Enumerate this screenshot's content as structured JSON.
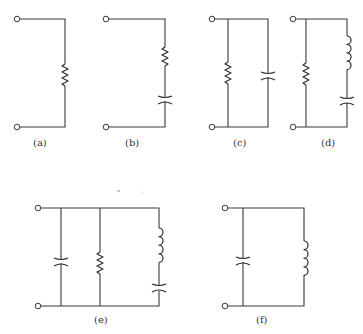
{
  "figure": {
    "circuits": [
      {
        "id": "a",
        "label": "(a)",
        "topology": "single element",
        "elements": [
          "resistor"
        ]
      },
      {
        "id": "b",
        "label": "(b)",
        "topology": "series",
        "elements": [
          "resistor",
          "capacitor"
        ]
      },
      {
        "id": "c",
        "label": "(c)",
        "topology": "parallel",
        "elements": [
          "resistor",
          "capacitor"
        ]
      },
      {
        "id": "d",
        "label": "(d)",
        "topology": "resistor in parallel with series inductor-capacitor",
        "elements": [
          "resistor",
          "inductor",
          "capacitor"
        ]
      },
      {
        "id": "e",
        "label": "(e)",
        "topology": "capacitor parallel resistor parallel series inductor-capacitor",
        "elements": [
          "capacitor",
          "resistor",
          "inductor",
          "capacitor"
        ]
      },
      {
        "id": "f",
        "label": "(f)",
        "topology": "parallel",
        "elements": [
          "capacitor",
          "inductor"
        ]
      }
    ]
  },
  "colors": {
    "line": "#3a3a3a",
    "background": "#ffffff"
  }
}
